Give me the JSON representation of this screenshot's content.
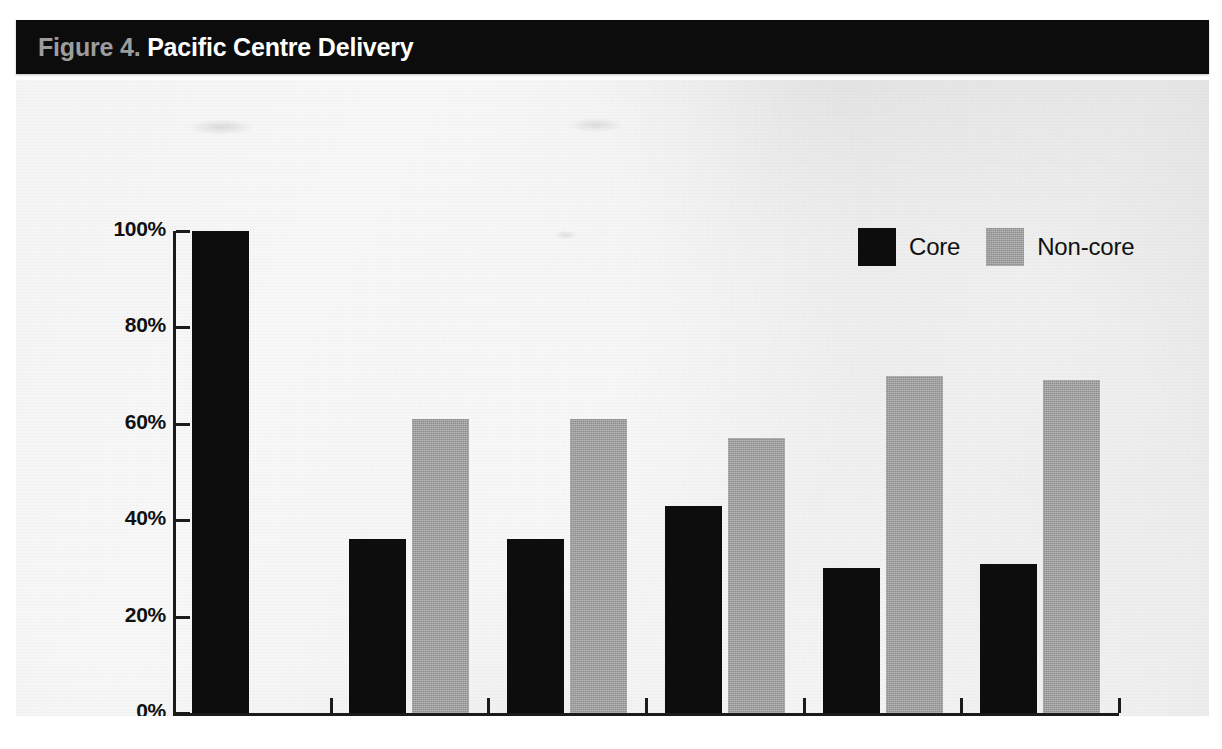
{
  "figure": {
    "label_prefix": "Figure 4.",
    "title": "Pacific Centre Delivery"
  },
  "legend": {
    "position": "top-right",
    "items": [
      {
        "label": "Core",
        "color": "#0d0d0d",
        "swatch": "core-swatch"
      },
      {
        "label": "Non-core",
        "color": "#9c9c9c",
        "swatch": "noncore-swatch"
      }
    ]
  },
  "axes": {
    "y_ticks": [
      "0%",
      "20%",
      "40%",
      "60%",
      "80%",
      "100%"
    ],
    "x_ticks": [
      "2005",
      "2006",
      "2007",
      "2008",
      "2009",
      "2010"
    ]
  },
  "colors": {
    "title_bar": "#0c0c0c",
    "title_prefix": "#9d9d9d",
    "title_main": "#ffffff",
    "panel": "#eeeeee",
    "axis": "#1b1b1b",
    "core": "#0d0d0d",
    "noncore": "#9c9c9c"
  },
  "chart_data": {
    "type": "bar",
    "xlabel": "",
    "ylabel": "",
    "categories": [
      "2005",
      "2006",
      "2007",
      "2008",
      "2009",
      "2010"
    ],
    "series": [
      {
        "name": "Core",
        "color": "#0d0d0d",
        "values": [
          100,
          36,
          36,
          43,
          30,
          31
        ]
      },
      {
        "name": "Non-core",
        "color": "#9c9c9c",
        "values": [
          null,
          61,
          61,
          57,
          70,
          69
        ]
      }
    ],
    "ylim": [
      0,
      100
    ],
    "yticks": [
      0,
      20,
      40,
      60,
      80,
      100
    ],
    "ytick_labels": [
      "0%",
      "20%",
      "40%",
      "60%",
      "80%",
      "100%"
    ],
    "grid": false,
    "legend_position": "upper right",
    "units": "percent"
  }
}
